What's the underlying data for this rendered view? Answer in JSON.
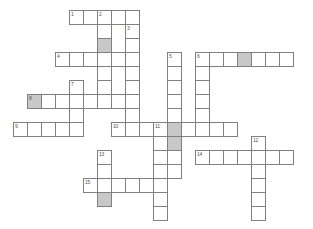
{
  "puzzle": {
    "title": "Crossword Grid",
    "cell_size": 14,
    "origin_x": 13,
    "origin_y": 10,
    "colors": {
      "background": "#ffffff",
      "cell_fill": "#ffffff",
      "cell_border": "#808080",
      "shaded_fill": "#c8c8c8",
      "number_text": "#555555"
    },
    "entries": [
      {
        "number": "1",
        "direction": "across",
        "col": 4,
        "row": 0,
        "length": 5
      },
      {
        "number": "2",
        "direction": "down",
        "col": 6,
        "row": 0,
        "length": 7
      },
      {
        "number": "3",
        "direction": "down",
        "col": 8,
        "row": 1,
        "length": 5
      },
      {
        "number": "4",
        "direction": "across",
        "col": 3,
        "row": 3,
        "length": 5
      },
      {
        "number": "5",
        "direction": "down",
        "col": 11,
        "row": 3,
        "length": 8
      },
      {
        "number": "6",
        "direction": "across",
        "col": 13,
        "row": 3,
        "length": 7
      },
      {
        "number": "6",
        "direction": "down",
        "col": 13,
        "row": 3,
        "length": 5
      },
      {
        "number": "7",
        "direction": "down",
        "col": 4,
        "row": 5,
        "length": 4
      },
      {
        "number": "8",
        "direction": "across",
        "col": 1,
        "row": 6,
        "length": 8
      },
      {
        "number": "9",
        "direction": "across",
        "col": 0,
        "row": 8,
        "length": 5
      },
      {
        "number": "10",
        "direction": "across",
        "col": 7,
        "row": 8,
        "length": 9
      },
      {
        "number": "11",
        "direction": "down",
        "col": 10,
        "row": 8,
        "length": 8
      },
      {
        "number": "12",
        "direction": "down",
        "col": 17,
        "row": 9,
        "length": 6
      },
      {
        "number": "13",
        "direction": "down",
        "col": 6,
        "row": 10,
        "length": 4
      },
      {
        "number": "14",
        "direction": "across",
        "col": 13,
        "row": 10,
        "length": 7
      },
      {
        "number": "15",
        "direction": "across",
        "col": 5,
        "row": 12,
        "length": 5
      }
    ],
    "cells": [
      {
        "col": 4,
        "row": 0,
        "shaded": false,
        "number": "1"
      },
      {
        "col": 5,
        "row": 0,
        "shaded": false,
        "number": ""
      },
      {
        "col": 6,
        "row": 0,
        "shaded": false,
        "number": "2"
      },
      {
        "col": 7,
        "row": 0,
        "shaded": false,
        "number": ""
      },
      {
        "col": 8,
        "row": 0,
        "shaded": false,
        "number": ""
      },
      {
        "col": 6,
        "row": 1,
        "shaded": false,
        "number": ""
      },
      {
        "col": 8,
        "row": 1,
        "shaded": false,
        "number": "3"
      },
      {
        "col": 6,
        "row": 2,
        "shaded": true,
        "number": ""
      },
      {
        "col": 8,
        "row": 2,
        "shaded": false,
        "number": ""
      },
      {
        "col": 3,
        "row": 3,
        "shaded": false,
        "number": "4"
      },
      {
        "col": 4,
        "row": 3,
        "shaded": false,
        "number": ""
      },
      {
        "col": 5,
        "row": 3,
        "shaded": false,
        "number": ""
      },
      {
        "col": 6,
        "row": 3,
        "shaded": false,
        "number": ""
      },
      {
        "col": 7,
        "row": 3,
        "shaded": false,
        "number": ""
      },
      {
        "col": 8,
        "row": 3,
        "shaded": false,
        "number": ""
      },
      {
        "col": 11,
        "row": 3,
        "shaded": false,
        "number": "5"
      },
      {
        "col": 13,
        "row": 3,
        "shaded": false,
        "number": "6"
      },
      {
        "col": 14,
        "row": 3,
        "shaded": false,
        "number": ""
      },
      {
        "col": 15,
        "row": 3,
        "shaded": false,
        "number": ""
      },
      {
        "col": 16,
        "row": 3,
        "shaded": true,
        "number": ""
      },
      {
        "col": 17,
        "row": 3,
        "shaded": false,
        "number": ""
      },
      {
        "col": 18,
        "row": 3,
        "shaded": false,
        "number": ""
      },
      {
        "col": 19,
        "row": 3,
        "shaded": false,
        "number": ""
      },
      {
        "col": 6,
        "row": 4,
        "shaded": false,
        "number": ""
      },
      {
        "col": 8,
        "row": 4,
        "shaded": false,
        "number": ""
      },
      {
        "col": 11,
        "row": 4,
        "shaded": false,
        "number": ""
      },
      {
        "col": 13,
        "row": 4,
        "shaded": false,
        "number": ""
      },
      {
        "col": 4,
        "row": 5,
        "shaded": false,
        "number": "7"
      },
      {
        "col": 6,
        "row": 5,
        "shaded": false,
        "number": ""
      },
      {
        "col": 8,
        "row": 5,
        "shaded": false,
        "number": ""
      },
      {
        "col": 11,
        "row": 5,
        "shaded": false,
        "number": ""
      },
      {
        "col": 13,
        "row": 5,
        "shaded": false,
        "number": ""
      },
      {
        "col": 1,
        "row": 6,
        "shaded": true,
        "number": "8"
      },
      {
        "col": 2,
        "row": 6,
        "shaded": false,
        "number": ""
      },
      {
        "col": 3,
        "row": 6,
        "shaded": false,
        "number": ""
      },
      {
        "col": 4,
        "row": 6,
        "shaded": false,
        "number": ""
      },
      {
        "col": 5,
        "row": 6,
        "shaded": false,
        "number": ""
      },
      {
        "col": 6,
        "row": 6,
        "shaded": false,
        "number": ""
      },
      {
        "col": 7,
        "row": 6,
        "shaded": false,
        "number": ""
      },
      {
        "col": 8,
        "row": 6,
        "shaded": false,
        "number": ""
      },
      {
        "col": 11,
        "row": 6,
        "shaded": false,
        "number": ""
      },
      {
        "col": 13,
        "row": 6,
        "shaded": false,
        "number": ""
      },
      {
        "col": 4,
        "row": 7,
        "shaded": false,
        "number": ""
      },
      {
        "col": 8,
        "row": 7,
        "shaded": false,
        "number": ""
      },
      {
        "col": 11,
        "row": 7,
        "shaded": false,
        "number": ""
      },
      {
        "col": 13,
        "row": 7,
        "shaded": false,
        "number": ""
      },
      {
        "col": 0,
        "row": 8,
        "shaded": false,
        "number": "9"
      },
      {
        "col": 1,
        "row": 8,
        "shaded": false,
        "number": ""
      },
      {
        "col": 2,
        "row": 8,
        "shaded": false,
        "number": ""
      },
      {
        "col": 3,
        "row": 8,
        "shaded": false,
        "number": ""
      },
      {
        "col": 4,
        "row": 8,
        "shaded": false,
        "number": ""
      },
      {
        "col": 7,
        "row": 8,
        "shaded": false,
        "number": "10"
      },
      {
        "col": 8,
        "row": 8,
        "shaded": false,
        "number": ""
      },
      {
        "col": 9,
        "row": 8,
        "shaded": false,
        "number": ""
      },
      {
        "col": 10,
        "row": 8,
        "shaded": false,
        "number": "11"
      },
      {
        "col": 11,
        "row": 8,
        "shaded": true,
        "number": ""
      },
      {
        "col": 12,
        "row": 8,
        "shaded": false,
        "number": ""
      },
      {
        "col": 13,
        "row": 8,
        "shaded": false,
        "number": ""
      },
      {
        "col": 14,
        "row": 8,
        "shaded": false,
        "number": ""
      },
      {
        "col": 15,
        "row": 8,
        "shaded": false,
        "number": ""
      },
      {
        "col": 10,
        "row": 9,
        "shaded": false,
        "number": ""
      },
      {
        "col": 11,
        "row": 9,
        "shaded": true,
        "number": ""
      },
      {
        "col": 17,
        "row": 9,
        "shaded": false,
        "number": "12"
      },
      {
        "col": 10,
        "row": 10,
        "shaded": false,
        "number": ""
      },
      {
        "col": 11,
        "row": 10,
        "shaded": false,
        "number": ""
      },
      {
        "col": 6,
        "row": 10,
        "shaded": false,
        "number": "13"
      },
      {
        "col": 13,
        "row": 10,
        "shaded": false,
        "number": "14"
      },
      {
        "col": 14,
        "row": 10,
        "shaded": false,
        "number": ""
      },
      {
        "col": 15,
        "row": 10,
        "shaded": false,
        "number": ""
      },
      {
        "col": 16,
        "row": 10,
        "shaded": false,
        "number": ""
      },
      {
        "col": 17,
        "row": 10,
        "shaded": false,
        "number": ""
      },
      {
        "col": 18,
        "row": 10,
        "shaded": false,
        "number": ""
      },
      {
        "col": 19,
        "row": 10,
        "shaded": false,
        "number": ""
      },
      {
        "col": 6,
        "row": 11,
        "shaded": false,
        "number": ""
      },
      {
        "col": 10,
        "row": 11,
        "shaded": false,
        "number": ""
      },
      {
        "col": 11,
        "row": 11,
        "shaded": false,
        "number": ""
      },
      {
        "col": 17,
        "row": 11,
        "shaded": false,
        "number": ""
      },
      {
        "col": 5,
        "row": 12,
        "shaded": false,
        "number": "15"
      },
      {
        "col": 6,
        "row": 12,
        "shaded": false,
        "number": ""
      },
      {
        "col": 7,
        "row": 12,
        "shaded": false,
        "number": ""
      },
      {
        "col": 8,
        "row": 12,
        "shaded": false,
        "number": ""
      },
      {
        "col": 9,
        "row": 12,
        "shaded": false,
        "number": ""
      },
      {
        "col": 10,
        "row": 12,
        "shaded": false,
        "number": ""
      },
      {
        "col": 17,
        "row": 12,
        "shaded": false,
        "number": ""
      },
      {
        "col": 6,
        "row": 13,
        "shaded": true,
        "number": ""
      },
      {
        "col": 10,
        "row": 13,
        "shaded": false,
        "number": ""
      },
      {
        "col": 17,
        "row": 13,
        "shaded": false,
        "number": ""
      },
      {
        "col": 10,
        "row": 14,
        "shaded": false,
        "number": ""
      },
      {
        "col": 17,
        "row": 14,
        "shaded": false,
        "number": ""
      }
    ]
  }
}
